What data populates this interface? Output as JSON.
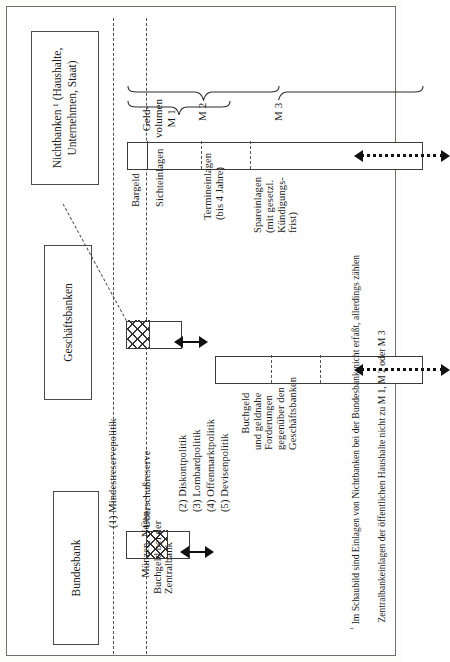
{
  "document": {
    "type": "diagram",
    "orientation": "rotated-90-landscape",
    "title_boxes": {
      "nichtbanken": "Nichtbanken ¹ (Haushalte,\nUnternehmen, Staat)",
      "geschaeftsbanken": "Geschäftsbanken",
      "bundesbank": "Bundesbank"
    },
    "money_aggregates": {
      "m1_label": "Geld-\nvolumen\nM 1",
      "m2_label": "M 2",
      "m3_label": "M 3"
    },
    "nichtbanken_segments": [
      "Bargeld",
      "Sichteinlagen",
      "Termineinlagen\n(bis 4 Jahre)",
      "Spareinlagen\n(mit gesetzl.\nKündigungs-\nfrist)"
    ],
    "geschaeftsbanken_caption": "Buchgeld\nund geldnahe\nForderungen\ngegenüber den\nGeschäftsbanken",
    "bundesbank_caption": "Münzen, Noten,\nBuchgeld bei der\nZentralbank",
    "policy_instruments": [
      "(1) Mindestreservepolitik",
      "Überschußreserve",
      "(2) Diskontpolitik",
      "(3) Lombardpolitik",
      "(4) Offenmarktpolitik",
      "(5) Devisenpolitik"
    ],
    "footnote": {
      "marker": "¹",
      "line1": "Im Schaubild sind Einlagen von Nichtbanken bei der Bundesbank nicht erfaßt, allerdings zählen",
      "line2": "Zentralbankeinlagen der öffentlichen Haushalte nicht zu M 1, M 2 oder M 3"
    },
    "colors": {
      "ink": "#1a1a1a",
      "rule": "#3b3b3b",
      "dash": "#4f4f4f",
      "paper": "#fdfdfc"
    }
  }
}
